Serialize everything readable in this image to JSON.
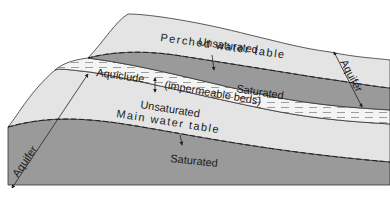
{
  "diagram": {
    "type": "geologic cross-section",
    "colors": {
      "background": "#ffffff",
      "unsaturated": "#e4e4e4",
      "saturated": "#9a9a9a",
      "aquiclude": "#f4f4f4",
      "line": "#333333"
    },
    "labels": {
      "perched_unsaturated": "Unsaturated",
      "perched_water_table": "Perched water table",
      "perched_saturated": "Saturated",
      "aquiclude": "Aquiclude",
      "impermeable": "(impermeable beds)",
      "main_unsaturated": "Unsaturated",
      "main_water_table": "Main water table",
      "main_saturated": "Saturated",
      "aquifer_left": "Aquifer",
      "aquifer_right": "Aquifer"
    }
  }
}
